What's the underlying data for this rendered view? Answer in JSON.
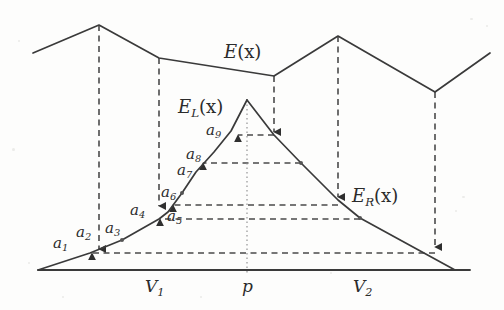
{
  "figure": {
    "background_color": "#fdfdfc",
    "stroke_color": "#3a3a3a",
    "dash_color": "#4a4a4a"
  },
  "curves": {
    "E": {
      "label": "E(x)",
      "label_base": "E",
      "label_paren": "(x)",
      "points": [
        [
          33,
          53
        ],
        [
          99,
          25
        ],
        [
          159,
          58
        ],
        [
          274,
          76
        ],
        [
          338,
          36
        ],
        [
          435,
          92
        ],
        [
          490,
          53
        ]
      ]
    },
    "EL": {
      "label": "E_L(x)",
      "label_base": "E",
      "label_sub": "L",
      "label_paren": "(x)",
      "points": [
        [
          38,
          270
        ],
        [
          90,
          253
        ],
        [
          122,
          240
        ],
        [
          159,
          219
        ],
        [
          168,
          212
        ],
        [
          182,
          193
        ],
        [
          196,
          172
        ],
        [
          214,
          152
        ],
        [
          231,
          131
        ],
        [
          247,
          100
        ]
      ]
    },
    "ER": {
      "label": "E_R(x)",
      "label_base": "E",
      "label_sub": "R",
      "label_paren": "(x)",
      "points": [
        [
          247,
          100
        ],
        [
          274,
          135
        ],
        [
          301,
          163
        ],
        [
          338,
          200
        ],
        [
          360,
          218
        ],
        [
          455,
          270
        ]
      ]
    },
    "baseline": {
      "points": [
        [
          38,
          270
        ],
        [
          470,
          270
        ]
      ]
    },
    "p_axis": {
      "x": 247,
      "y_top": 100,
      "y_bottom": 274
    }
  },
  "vertical_droplines": [
    {
      "name": "dropline-1",
      "x": 99,
      "y_top": 25,
      "y_bottom": 249
    },
    {
      "name": "dropline-2",
      "x": 159,
      "y_top": 58,
      "y_bottom": 206
    },
    {
      "name": "dropline-3",
      "x": 274,
      "y_top": 76,
      "y_bottom": 132
    },
    {
      "name": "dropline-4",
      "x": 338,
      "y_top": 36,
      "y_bottom": 197
    },
    {
      "name": "dropline-5",
      "x": 435,
      "y_top": 92,
      "y_bottom": 247
    }
  ],
  "horizontal_links": [
    {
      "name": "link-a9",
      "y": 135,
      "x_from": 274,
      "x_to": 238
    },
    {
      "name": "link-a8",
      "y": 163,
      "x_from": 301,
      "x_to": 203
    },
    {
      "name": "link-a6",
      "y": 205,
      "x_from": 338,
      "x_to": 173
    },
    {
      "name": "link-a5",
      "y": 219,
      "x_from": 360,
      "x_to": 160
    },
    {
      "name": "link-a1",
      "y": 253,
      "x_from": 435,
      "x_to": 92
    }
  ],
  "vertex_dots": [
    {
      "name": "vertex-a3",
      "x": 122,
      "y": 240
    },
    {
      "name": "vertex-a7",
      "x": 182,
      "y": 193
    },
    {
      "name": "vertex-er-1",
      "x": 301,
      "y": 163
    },
    {
      "name": "vertex-er-2",
      "x": 360,
      "y": 218
    }
  ],
  "point_labels": [
    {
      "name": "label-a1",
      "base": "a",
      "sub": "1",
      "x": 53,
      "y": 236
    },
    {
      "name": "label-a2",
      "base": "a",
      "sub": "2",
      "x": 76,
      "y": 225
    },
    {
      "name": "label-a3",
      "base": "a",
      "sub": "3",
      "x": 105,
      "y": 221
    },
    {
      "name": "label-a4",
      "base": "a",
      "sub": "4",
      "x": 130,
      "y": 203
    },
    {
      "name": "label-a5",
      "base": "a",
      "sub": "5",
      "x": 167,
      "y": 209
    },
    {
      "name": "label-a6",
      "base": "a",
      "sub": "6",
      "x": 161,
      "y": 185
    },
    {
      "name": "label-a7",
      "base": "a",
      "sub": "7",
      "x": 177,
      "y": 163
    },
    {
      "name": "label-a8",
      "base": "a",
      "sub": "8",
      "x": 186,
      "y": 147
    },
    {
      "name": "label-a9",
      "base": "a",
      "sub": "9",
      "x": 206,
      "y": 123
    }
  ],
  "axis_labels": [
    {
      "name": "label-v1",
      "base": "V",
      "sub": "1",
      "x": 145,
      "y": 278
    },
    {
      "name": "label-p",
      "base": "p",
      "sub": "",
      "x": 242,
      "y": 278
    },
    {
      "name": "label-v2",
      "base": "V",
      "sub": "2",
      "x": 353,
      "y": 278
    }
  ],
  "curve_labels": [
    {
      "name": "label-E",
      "base": "E",
      "sub": "",
      "paren": "(x)",
      "x": 224,
      "y": 43
    },
    {
      "name": "label-EL",
      "base": "E",
      "sub": "L",
      "paren": "(x)",
      "x": 178,
      "y": 98
    },
    {
      "name": "label-ER",
      "base": "E",
      "sub": "R",
      "paren": "(x)",
      "x": 352,
      "y": 187
    }
  ]
}
